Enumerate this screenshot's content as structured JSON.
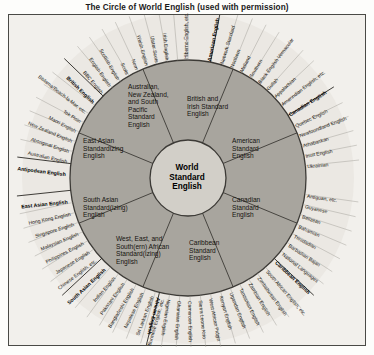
{
  "title": "The Circle of World English (used with permission)",
  "core": {
    "lines": [
      "World",
      "Standard",
      "English"
    ]
  },
  "inner_sectors": [
    {
      "name": "east-asian",
      "text": "East Asian\nStandardizing\nEnglish"
    },
    {
      "name": "antipodean",
      "text": "Australian,\nNew Zealand,\nand South\nPacific\nStandard\nEnglish"
    },
    {
      "name": "british-irish",
      "text": "British and\nIrish Standard\nEnglish"
    },
    {
      "name": "american",
      "text": "American\nStandard\nEnglish"
    },
    {
      "name": "canadian",
      "text": "Canadian\nStandard\nEnglish"
    },
    {
      "name": "caribbean",
      "text": "Caribbean\nStandard\nEnglish"
    },
    {
      "name": "african",
      "text": "West, East, and\nSouth(ern) African\nStandard(izing)\nEnglish"
    },
    {
      "name": "south-asian",
      "text": "South Asian\nStandard(izing)\nEnglish"
    }
  ],
  "outer_labels": [
    {
      "text": "African English",
      "bold": true,
      "angle": -104
    },
    {
      "text": "Nigerian English",
      "bold": false,
      "angle": -99
    },
    {
      "text": "Ghanaian English",
      "bold": false,
      "angle": -94
    },
    {
      "text": "Cameroon English",
      "bold": false,
      "angle": -89
    },
    {
      "text": "Sierra Leone Krio",
      "bold": false,
      "angle": -84
    },
    {
      "text": "West African Pidgin",
      "bold": false,
      "angle": -79
    },
    {
      "text": "Kenyan English",
      "bold": false,
      "angle": -74
    },
    {
      "text": "Ugandan English",
      "bold": false,
      "angle": -69
    },
    {
      "text": "Tanzanian English",
      "bold": false,
      "angle": -64
    },
    {
      "text": "Zambian English",
      "bold": false,
      "angle": -59
    },
    {
      "text": "Zimbabwean English",
      "bold": false,
      "angle": -54
    },
    {
      "text": "South African English, etc.",
      "bold": false,
      "angle": -49
    },
    {
      "text": "Caribbean English",
      "bold": true,
      "angle": -43
    },
    {
      "text": "National Languages",
      "bold": false,
      "angle": -38
    },
    {
      "text": "Barbadian Bajan",
      "bold": false,
      "angle": -33
    },
    {
      "text": "Trinidadian",
      "bold": false,
      "angle": -28
    },
    {
      "text": "Bahamian",
      "bold": false,
      "angle": -23
    },
    {
      "text": "Belizean",
      "bold": false,
      "angle": -18
    },
    {
      "text": "Guyanese",
      "bold": false,
      "angle": -13
    },
    {
      "text": "Antiguan, etc.",
      "bold": false,
      "angle": -8
    },
    {
      "text": "Ukrainian",
      "bold": false,
      "angle": 6
    },
    {
      "text": "Inuit English",
      "bold": false,
      "angle": 11
    },
    {
      "text": "Athabaskan",
      "bold": false,
      "angle": 16
    },
    {
      "text": "Newfoundland English",
      "bold": false,
      "angle": 21
    },
    {
      "text": "Quebec English",
      "bold": false,
      "angle": 26
    },
    {
      "text": "Canadian English",
      "bold": true,
      "angle": 32
    },
    {
      "text": "Amerindian English, etc.",
      "bold": false,
      "angle": 38
    },
    {
      "text": "Appalachian",
      "bold": false,
      "angle": 43
    },
    {
      "text": "Gullah",
      "bold": false,
      "angle": 48
    },
    {
      "text": "Black English Vernacular",
      "bold": false,
      "angle": 53
    },
    {
      "text": "Southern",
      "bold": false,
      "angle": 58
    },
    {
      "text": "Midland",
      "bold": false,
      "angle": 63
    },
    {
      "text": "Northern",
      "bold": false,
      "angle": 68
    },
    {
      "text": "Network Standard",
      "bold": false,
      "angle": 73
    },
    {
      "text": "American English",
      "bold": true,
      "angle": 79
    },
    {
      "text": "Hiberno-English, etc.",
      "bold": false,
      "angle": 90
    },
    {
      "text": "Irish English",
      "bold": false,
      "angle": 95
    },
    {
      "text": "Ulster Scots",
      "bold": false,
      "angle": 100
    },
    {
      "text": "Welsh English",
      "bold": false,
      "angle": 105
    },
    {
      "text": "Norn",
      "bold": false,
      "angle": 110
    },
    {
      "text": "Scots",
      "bold": false,
      "angle": 115
    },
    {
      "text": "Scottish English",
      "bold": false,
      "angle": 120
    },
    {
      "text": "English English",
      "bold": false,
      "angle": 125
    },
    {
      "text": "BBC English",
      "bold": false,
      "angle": 130
    },
    {
      "text": "British English",
      "bold": true,
      "angle": 136
    },
    {
      "text": "Bislama/Beach-la-Mar, etc.",
      "bold": false,
      "angle": 142
    },
    {
      "text": "Tok Pisin",
      "bold": false,
      "angle": 147
    },
    {
      "text": "Maori English",
      "bold": false,
      "angle": 152
    },
    {
      "text": "New Zealand English",
      "bold": false,
      "angle": 157
    },
    {
      "text": "Aboriginal English",
      "bold": false,
      "angle": 162
    },
    {
      "text": "Australian English",
      "bold": false,
      "angle": 167
    },
    {
      "text": "Antipodean English",
      "bold": true,
      "angle": 173
    },
    {
      "text": "East Asian English",
      "bold": true,
      "angle": 186
    },
    {
      "text": "Hong Kong English",
      "bold": false,
      "angle": 192
    },
    {
      "text": "Singapore English",
      "bold": false,
      "angle": 197
    },
    {
      "text": "Malaysian English",
      "bold": false,
      "angle": 202
    },
    {
      "text": "Philippines English",
      "bold": false,
      "angle": 207
    },
    {
      "text": "Japanese English",
      "bold": false,
      "angle": 212
    },
    {
      "text": "Chinese English, etc.",
      "bold": false,
      "angle": 217
    },
    {
      "text": "South Asian English",
      "bold": true,
      "angle": 223
    },
    {
      "text": "Indian English",
      "bold": false,
      "angle": 229
    },
    {
      "text": "Pakistani English",
      "bold": false,
      "angle": 234
    },
    {
      "text": "Bangladeshi English",
      "bold": false,
      "angle": 239
    },
    {
      "text": "Nepalese English",
      "bold": false,
      "angle": 244
    },
    {
      "text": "Sri Lankan English",
      "bold": false,
      "angle": 249
    },
    {
      "text": "Burmese English, etc.",
      "bold": false,
      "angle": 254
    }
  ],
  "colors": {
    "ring_fill": "#a8a59e",
    "outer_band": "#ebe8e3",
    "core_fill": "#d2cfc8",
    "line": "#3c3a36",
    "background": "#f2f0ec"
  }
}
